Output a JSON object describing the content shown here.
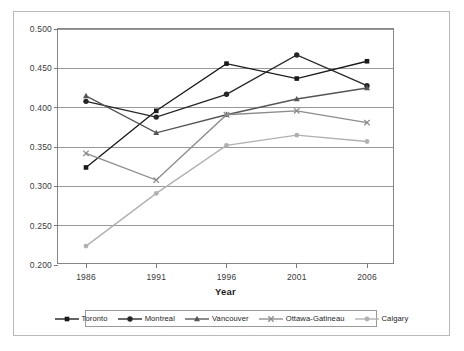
{
  "chart_data": {
    "type": "line",
    "title": "",
    "xlabel": "Year",
    "ylabel": "",
    "categories": [
      "1986",
      "1991",
      "1996",
      "2001",
      "2006"
    ],
    "x": [
      1986,
      1991,
      1996,
      2001,
      2006
    ],
    "ylim": [
      0.2,
      0.5
    ],
    "yticks": [
      "0.200",
      "0.250",
      "0.300",
      "0.350",
      "0.400",
      "0.450",
      "0.500"
    ],
    "ytick_values": [
      0.2,
      0.25,
      0.3,
      0.35,
      0.4,
      0.45,
      0.5
    ],
    "grid": true,
    "legend_position": "bottom",
    "series": [
      {
        "name": "Toronto",
        "values": [
          0.324,
          0.396,
          0.456,
          0.437,
          0.459
        ],
        "color": "#1a1a1a",
        "marker": "square"
      },
      {
        "name": "Montreal",
        "values": [
          0.408,
          0.388,
          0.417,
          0.467,
          0.428
        ],
        "color": "#262626",
        "marker": "circle"
      },
      {
        "name": "Vancouver",
        "values": [
          0.415,
          0.368,
          0.391,
          0.411,
          0.425
        ],
        "color": "#555555",
        "marker": "triangle"
      },
      {
        "name": "Ottawa-Gatineau",
        "values": [
          0.342,
          0.308,
          0.391,
          0.396,
          0.381
        ],
        "color": "#8c8c8c",
        "marker": "cross"
      },
      {
        "name": "Calgary",
        "values": [
          0.224,
          0.291,
          0.352,
          0.365,
          0.357
        ],
        "color": "#b0b0b0",
        "marker": "circle-small"
      }
    ]
  },
  "legend": {
    "items": [
      {
        "label": "Toronto"
      },
      {
        "label": "Montreal"
      },
      {
        "label": "Vancouver"
      },
      {
        "label": "Ottawa-Gatineau"
      },
      {
        "label": "Calgary"
      }
    ]
  }
}
